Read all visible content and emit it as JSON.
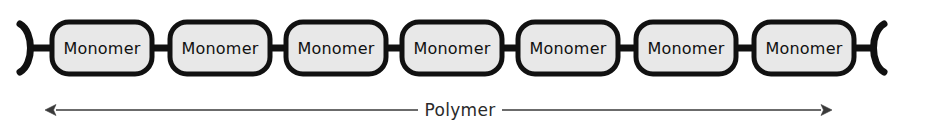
{
  "figure": {
    "type": "diagram",
    "background_color": "#ffffff",
    "width": 947,
    "height": 129
  },
  "chain": {
    "unit_label": "Monomer",
    "unit_count": 7,
    "fill_color": "#e8e8e8",
    "stroke_color": "#111111",
    "stroke_width": 5,
    "units": [
      {
        "label": "Monomer",
        "x": 52,
        "y": 22,
        "w": 100,
        "h": 52
      },
      {
        "label": "Monomer",
        "x": 170,
        "y": 22,
        "w": 100,
        "h": 52
      },
      {
        "label": "Monomer",
        "x": 286,
        "y": 22,
        "w": 100,
        "h": 52
      },
      {
        "label": "Monomer",
        "x": 402,
        "y": 22,
        "w": 100,
        "h": 52
      },
      {
        "label": "Monomer",
        "x": 518,
        "y": 22,
        "w": 100,
        "h": 52
      },
      {
        "label": "Monomer",
        "x": 636,
        "y": 22,
        "w": 100,
        "h": 52
      },
      {
        "label": "Monomer",
        "x": 754,
        "y": 22,
        "w": 100,
        "h": 52
      }
    ],
    "connectors": [
      {
        "x1": 30,
        "x2": 52,
        "y": 48
      },
      {
        "x1": 152,
        "x2": 170,
        "y": 48
      },
      {
        "x1": 270,
        "x2": 286,
        "y": 48
      },
      {
        "x1": 386,
        "x2": 402,
        "y": 48
      },
      {
        "x1": 502,
        "x2": 518,
        "y": 48
      },
      {
        "x1": 618,
        "x2": 636,
        "y": 48
      },
      {
        "x1": 736,
        "x2": 754,
        "y": 48
      },
      {
        "x1": 854,
        "x2": 876,
        "y": 48
      }
    ],
    "left_bracket": {
      "glyph": ")",
      "x": 20,
      "y_top": 24,
      "y_bottom": 72
    },
    "right_bracket": {
      "glyph": "(",
      "x": 884,
      "y_top": 24,
      "y_bottom": 72
    }
  },
  "annotation": {
    "label": "Polymer",
    "label_x": 460,
    "label_y": 116,
    "line_y": 110,
    "line_start_x": 45,
    "line_end_x": 832,
    "arrow_left": true,
    "arrow_right": true,
    "color": "#3a3a3a"
  }
}
